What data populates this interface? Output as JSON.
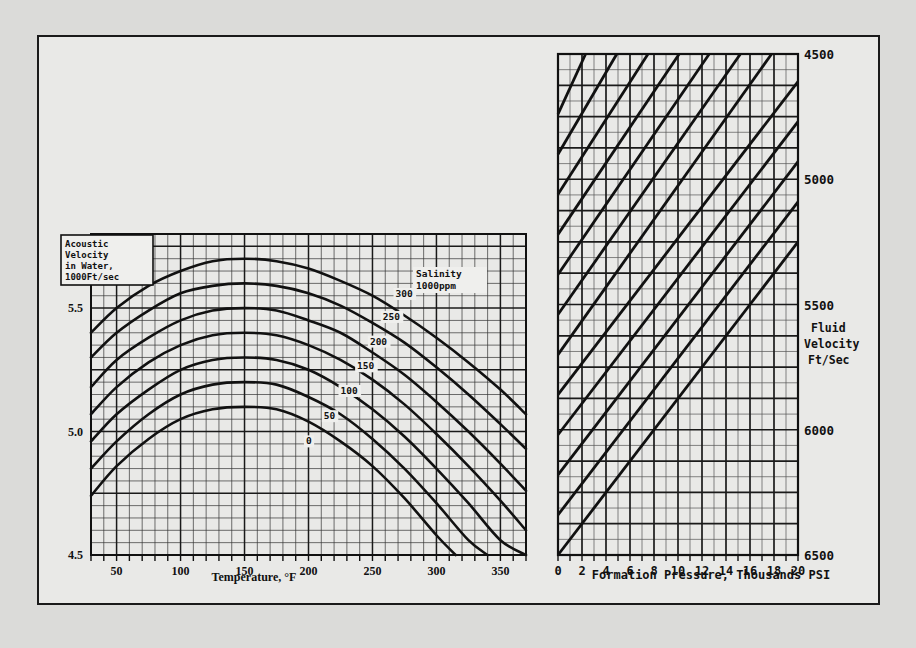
{
  "figure": {
    "background_color": "#e9e9e7",
    "ink_color": "#1a1a1a"
  },
  "left_chart": {
    "legend_box": {
      "line1": "Acoustic",
      "line2": "Velocity",
      "line3": "in Water,",
      "line4": "1000Ft/sec"
    },
    "salinity_header_line1": "Salinity",
    "salinity_header_line2": "1000ppm",
    "xlabel": "Temperature, °F",
    "x_ticks": [
      "50",
      "100",
      "150",
      "200",
      "250",
      "300",
      "350"
    ],
    "y_ticks": [
      "5.5",
      "5.0",
      "4.5"
    ],
    "curve_labels": [
      "300",
      "250",
      "200",
      "150",
      "100",
      "50",
      "0"
    ]
  },
  "right_chart": {
    "xlabel": "Formation Pressure, Thousands PSI",
    "x_ticks": [
      "0",
      "2",
      "4",
      "6",
      "8",
      "10",
      "12",
      "14",
      "16",
      "18",
      "20"
    ],
    "y_ticks": [
      "6500",
      "6000",
      "5500",
      "5000",
      "4500"
    ],
    "axis_title_line1": "Fluid",
    "axis_title_line2": "Velocity",
    "axis_title_line3": "Ft/Sec"
  },
  "chart_data": [
    {
      "type": "line",
      "id": "acoustic-velocity-vs-temperature",
      "title": "Acoustic Velocity in Water, 1000Ft/sec",
      "xlabel": "Temperature, °F",
      "ylabel": "Acoustic Velocity in Water, 1000Ft/sec",
      "xlim": [
        30,
        370
      ],
      "ylim": [
        4.5,
        5.8
      ],
      "x_ticks": [
        50,
        100,
        150,
        200,
        250,
        300,
        350
      ],
      "y_ticks": [
        4.5,
        5.0,
        5.5
      ],
      "grid": true,
      "legend": "Salinity 1000ppm",
      "series": [
        {
          "name": "300",
          "salinity_ppm_thousands": 300,
          "x": [
            30,
            50,
            75,
            100,
            125,
            150,
            175,
            200,
            225,
            250,
            275,
            300,
            325,
            350,
            370
          ],
          "y": [
            5.4,
            5.5,
            5.59,
            5.65,
            5.69,
            5.7,
            5.69,
            5.66,
            5.61,
            5.55,
            5.47,
            5.38,
            5.28,
            5.17,
            5.07
          ]
        },
        {
          "name": "250",
          "salinity_ppm_thousands": 250,
          "x": [
            30,
            50,
            75,
            100,
            125,
            150,
            175,
            200,
            225,
            250,
            275,
            300,
            325,
            350,
            370
          ],
          "y": [
            5.3,
            5.4,
            5.49,
            5.56,
            5.59,
            5.6,
            5.59,
            5.56,
            5.51,
            5.44,
            5.36,
            5.26,
            5.15,
            5.03,
            4.93
          ]
        },
        {
          "name": "200",
          "salinity_ppm_thousands": 200,
          "x": [
            30,
            50,
            75,
            100,
            125,
            150,
            175,
            200,
            225,
            250,
            275,
            300,
            325,
            350,
            370
          ],
          "y": [
            5.18,
            5.29,
            5.38,
            5.45,
            5.49,
            5.5,
            5.49,
            5.45,
            5.4,
            5.32,
            5.23,
            5.12,
            5.0,
            4.87,
            4.76
          ]
        },
        {
          "name": "150",
          "salinity_ppm_thousands": 150,
          "x": [
            30,
            50,
            75,
            100,
            125,
            150,
            175,
            200,
            225,
            250,
            275,
            300,
            325,
            350,
            370
          ],
          "y": [
            5.07,
            5.18,
            5.28,
            5.35,
            5.39,
            5.4,
            5.39,
            5.35,
            5.29,
            5.21,
            5.11,
            4.99,
            4.86,
            4.72,
            4.6
          ]
        },
        {
          "name": "100",
          "salinity_ppm_thousands": 100,
          "x": [
            30,
            50,
            75,
            100,
            125,
            150,
            175,
            200,
            225,
            250,
            275,
            300,
            325,
            350,
            370
          ],
          "y": [
            4.96,
            5.07,
            5.17,
            5.25,
            5.29,
            5.3,
            5.29,
            5.25,
            5.18,
            5.09,
            4.98,
            4.85,
            4.71,
            4.56,
            4.5
          ]
        },
        {
          "name": "50",
          "salinity_ppm_thousands": 50,
          "x": [
            30,
            50,
            75,
            100,
            125,
            150,
            175,
            200,
            225,
            250,
            275,
            300,
            325,
            340
          ],
          "y": [
            4.85,
            4.96,
            5.07,
            5.15,
            5.19,
            5.2,
            5.19,
            5.14,
            5.07,
            4.97,
            4.85,
            4.71,
            4.56,
            4.5
          ]
        },
        {
          "name": "0",
          "salinity_ppm_thousands": 0,
          "x": [
            30,
            50,
            75,
            100,
            125,
            150,
            175,
            200,
            225,
            250,
            275,
            300,
            315
          ],
          "y": [
            4.74,
            4.86,
            4.97,
            5.05,
            5.09,
            5.1,
            5.09,
            5.04,
            4.96,
            4.86,
            4.73,
            4.58,
            4.5
          ]
        }
      ]
    },
    {
      "type": "line",
      "id": "fluid-velocity-vs-formation-pressure",
      "title": "Fluid Velocity Ft/Sec vs Formation Pressure",
      "xlabel": "Formation Pressure, Thousands PSI",
      "ylabel": "Fluid Velocity Ft/Sec",
      "xlim": [
        0,
        20
      ],
      "ylim": [
        4500,
        6500
      ],
      "x_ticks": [
        0,
        2,
        4,
        6,
        8,
        10,
        12,
        14,
        16,
        18,
        20
      ],
      "y_ticks": [
        4500,
        5000,
        5500,
        6000,
        6500
      ],
      "grid": true,
      "note": "family of parallel straight lines, slope ~ +62.5 ft/sec per 1000 PSI",
      "series": [
        {
          "name": "line-1",
          "x": [
            0,
            20
          ],
          "y": [
            4500,
            5750
          ]
        },
        {
          "name": "line-2",
          "x": [
            0,
            20
          ],
          "y": [
            4660,
            5910
          ]
        },
        {
          "name": "line-3",
          "x": [
            0,
            20
          ],
          "y": [
            4820,
            6070
          ]
        },
        {
          "name": "line-4",
          "x": [
            0,
            20
          ],
          "y": [
            4980,
            6230
          ]
        },
        {
          "name": "line-5",
          "x": [
            0,
            20
          ],
          "y": [
            5140,
            6390
          ]
        },
        {
          "name": "line-6",
          "x": [
            0,
            17.8
          ],
          "y": [
            5300,
            6500
          ]
        },
        {
          "name": "line-7",
          "x": [
            0,
            15.2
          ],
          "y": [
            5460,
            6500
          ]
        },
        {
          "name": "line-8",
          "x": [
            0,
            12.6
          ],
          "y": [
            5620,
            6500
          ]
        },
        {
          "name": "line-9",
          "x": [
            0,
            10.1
          ],
          "y": [
            5780,
            6500
          ]
        },
        {
          "name": "line-10",
          "x": [
            0,
            7.5
          ],
          "y": [
            5940,
            6500
          ]
        },
        {
          "name": "line-11",
          "x": [
            0,
            4.9
          ],
          "y": [
            6100,
            6500
          ]
        },
        {
          "name": "line-12",
          "x": [
            0,
            2.3
          ],
          "y": [
            6260,
            6500
          ]
        }
      ]
    }
  ]
}
